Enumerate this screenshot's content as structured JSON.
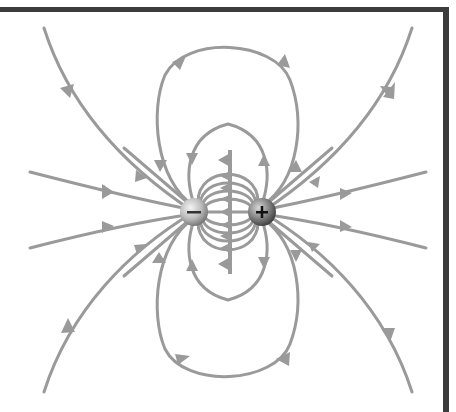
{
  "diagram": {
    "type": "electric-field-lines",
    "colors": {
      "field_line": "#9a9a9a",
      "border": "#3c3c3c",
      "background": "#ffffff",
      "charge_light": "#f2f2f2",
      "charge_dark": "#5a5a5a"
    },
    "charges": [
      {
        "id": "negative",
        "sign": "−",
        "cx": 194,
        "cy": 212,
        "r": 14
      },
      {
        "id": "positive",
        "sign": "+",
        "cx": 262,
        "cy": 212,
        "r": 14
      }
    ],
    "field_direction": "from positive charge to negative charge"
  }
}
